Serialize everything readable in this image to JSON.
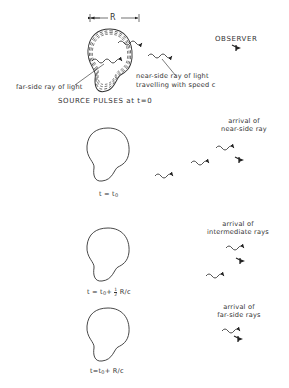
{
  "diagram": {
    "dimension_label": "R",
    "observer_label": "OBSERVER",
    "far_side_label": "far-side ray of light",
    "near_side_label_line1": "near-side ray of light",
    "near_side_label_line2": "travelling with speed c",
    "source_label": "SOURCE PULSES at t=0",
    "panels": [
      {
        "time_prefix": "t = t",
        "time_sub": "0",
        "time_suffix": "",
        "arrival_line1": "arrival of",
        "arrival_line2": "near-side ray"
      },
      {
        "time_prefix": "t = t",
        "time_sub": "0",
        "time_mid": "+ ",
        "frac_num": "1",
        "frac_den": "2",
        "time_suffix": " R/c",
        "arrival_line1": "arrival of",
        "arrival_line2": "intermediate rays"
      },
      {
        "time_prefix": "t=t",
        "time_sub": "0",
        "time_suffix": "+ R/c",
        "arrival_line1": "arrival of",
        "arrival_line2": "far-side rays"
      }
    ],
    "icons": [
      "observer-eye-icon",
      "wavy-ray-arrow-icon",
      "source-blob-shape"
    ]
  }
}
